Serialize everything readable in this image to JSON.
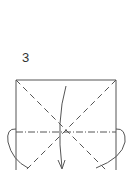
{
  "diagram": {
    "step_number": "3",
    "type": "origami-fold-instruction",
    "elements": {
      "square": "paper outline (solid)",
      "diagonals": "valley folds (dashed)",
      "horizontal": "mountain fold (dash-dot)",
      "arrows": [
        "center fold-down arrow",
        "left side fold arrow",
        "right side fold arrow"
      ]
    },
    "colors": {
      "line": "#555555",
      "background": "#ffffff"
    }
  }
}
